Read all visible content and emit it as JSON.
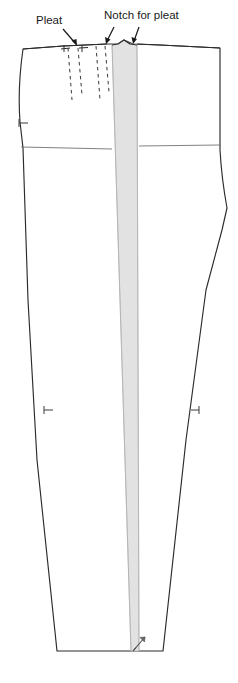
{
  "figure": {
    "width": 238,
    "height": 683,
    "background_color": "#ffffff"
  },
  "labels": [
    {
      "id": "pleat",
      "text": "Pleat",
      "x": 36,
      "y": 24,
      "anchor": "start"
    },
    {
      "id": "notch-for-pleat",
      "text": "Notch for pleat",
      "x": 104,
      "y": 19,
      "anchor": "start"
    }
  ],
  "colors": {
    "outline": "#2b2b2b",
    "inner_line": "#555555",
    "crease_panel_fill": "#e2e2e2",
    "crease_panel_stroke": "#b8b8b8",
    "dashed_pleat_line": "#3a3a3a",
    "label_text": "#1a1a1a",
    "notch_mark": "#3a3a3a",
    "leader_arrow": "#1a1a1a"
  },
  "elements": {
    "pattern_outline_name": "trouser-front-outline",
    "crease_panel_name": "crease-fold-panel",
    "hip_line_name": "hip-balance-line",
    "waist_line_name": "waist-line",
    "grainline_arrow_name": "grainline-arrow",
    "notch_count_waist": 3,
    "notch_count_side": 2,
    "pleat_dashed_lines": 4
  },
  "leaders": [
    {
      "id": "pleat-leader",
      "from_x": 63,
      "from_y": 29,
      "to_x": 76,
      "to_y": 45
    },
    {
      "id": "notch-leader-left",
      "from_x": 113,
      "from_y": 26,
      "to_x": 107,
      "to_y": 44
    },
    {
      "id": "notch-leader-right",
      "from_x": 138,
      "from_y": 26,
      "to_x": 133,
      "to_y": 44
    }
  ]
}
